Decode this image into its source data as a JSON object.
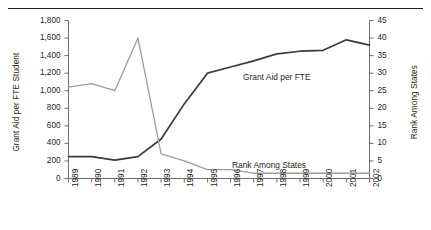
{
  "chart_data": {
    "type": "line",
    "title": "",
    "xlabel": "",
    "categories": [
      "1989",
      "1990",
      "1991",
      "1992",
      "1993",
      "1994",
      "1995",
      "1996",
      "1997",
      "1998",
      "1999",
      "2000",
      "2001",
      "2002"
    ],
    "grid": false,
    "legend_position": "inline-annotations",
    "axes": {
      "left": {
        "label": "Grant Aid per FTE Student",
        "ylim": [
          0,
          1800
        ],
        "tick_step": 200,
        "ticks": [
          0,
          200,
          400,
          600,
          800,
          1000,
          1200,
          1400,
          1600,
          1800
        ],
        "tick_labels": [
          "0",
          "200",
          "400",
          "600",
          "800",
          "1,000",
          "1,200",
          "1,400",
          "1,600",
          "1,800"
        ]
      },
      "right": {
        "label": "Rank Among States",
        "ylim": [
          0,
          45
        ],
        "tick_step": 5,
        "ticks": [
          0,
          5,
          10,
          15,
          20,
          25,
          30,
          35,
          40,
          45
        ],
        "tick_labels": [
          "0",
          "5",
          "10",
          "15",
          "20",
          "25",
          "30",
          "35",
          "40",
          "45"
        ]
      }
    },
    "series": [
      {
        "name": "Grant Aid per FTE",
        "axis": "left",
        "color": "#3a3a3a",
        "width": 1.7,
        "annotation": "Grant Aid per FTE",
        "values": [
          250,
          250,
          210,
          250,
          450,
          850,
          1200,
          1270,
          1340,
          1420,
          1450,
          1460,
          1580,
          1520
        ]
      },
      {
        "name": "Rank Among States",
        "axis": "right",
        "color": "#9d9d9d",
        "width": 1.3,
        "annotation": "Rank Among States",
        "values": [
          26,
          27,
          25,
          40,
          7,
          5,
          2.5,
          2.5,
          1.5,
          1.5,
          1.5,
          1.5,
          1.5,
          1.5
        ]
      }
    ]
  },
  "colors": {
    "grant_line": "#3a3a3a",
    "rank_line": "#9d9d9d",
    "axis": "#6d6d6d",
    "text": "#231f20",
    "rule": "#231f20",
    "background": "#ffffff"
  }
}
